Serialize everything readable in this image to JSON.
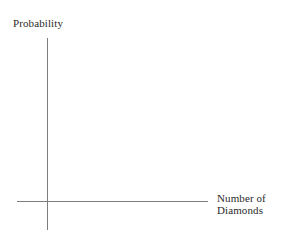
{
  "figure": {
    "background_color": "#ffffff",
    "axis_color": "#7d7d7d",
    "text_color": "#2b2b2b"
  },
  "chart_data": {
    "type": "line",
    "title": "",
    "subtitle": "",
    "xlabel": "Number of\nDiamonds",
    "ylabel": "Probability",
    "x": [],
    "values": [],
    "series": [],
    "categories": [],
    "xticks": [],
    "yticks": [],
    "xticklabels": [],
    "yticklabels": [],
    "grid": false,
    "legend": false,
    "annotations": []
  }
}
